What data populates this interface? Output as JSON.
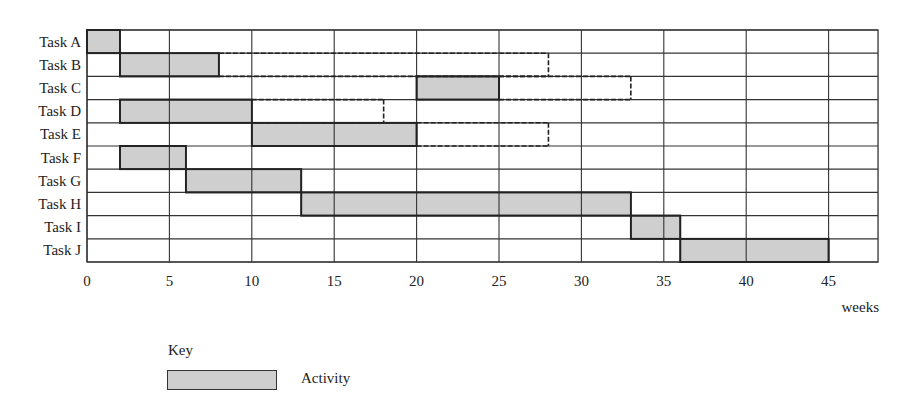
{
  "chart_data": {
    "type": "gantt",
    "title": "",
    "xlabel": "weeks",
    "ylabel": "",
    "xlim": [
      0,
      48
    ],
    "xticks": [
      0,
      5,
      10,
      15,
      20,
      25,
      30,
      35,
      40,
      45
    ],
    "grid": true,
    "tasks": [
      {
        "name": "Task A",
        "start": 0,
        "end": 2,
        "float_end": null
      },
      {
        "name": "Task B",
        "start": 2,
        "end": 8,
        "float_end": 28
      },
      {
        "name": "Task C",
        "start": 20,
        "end": 25,
        "float_end": 33
      },
      {
        "name": "Task D",
        "start": 2,
        "end": 10,
        "float_end": 18
      },
      {
        "name": "Task E",
        "start": 10,
        "end": 20,
        "float_end": 28
      },
      {
        "name": "Task F",
        "start": 2,
        "end": 6,
        "float_end": null
      },
      {
        "name": "Task G",
        "start": 6,
        "end": 13,
        "float_end": null
      },
      {
        "name": "Task H",
        "start": 13,
        "end": 33,
        "float_end": null
      },
      {
        "name": "Task I",
        "start": 33,
        "end": 36,
        "float_end": null
      },
      {
        "name": "Task J",
        "start": 36,
        "end": 45,
        "float_end": null
      }
    ],
    "legend": {
      "title": "Key",
      "entries": [
        {
          "label": "Activity",
          "style": "grey filled box"
        }
      ]
    },
    "colors": {
      "activity_fill": "#cfcfcf",
      "line": "#333333"
    }
  },
  "key": {
    "title": "Key",
    "activity_label": "Activity"
  },
  "axis": {
    "unit_label": "weeks"
  }
}
